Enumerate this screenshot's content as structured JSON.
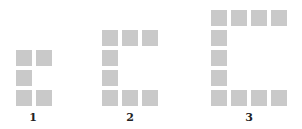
{
  "diagram": {
    "type": "pattern-sequence",
    "square_color": "#c9c9c9",
    "figures": [
      {
        "label": "1",
        "cells": [
          [
            0,
            0
          ],
          [
            1,
            0
          ],
          [
            0,
            1
          ],
          [
            0,
            2
          ],
          [
            1,
            2
          ]
        ],
        "origin": [
          16,
          50
        ]
      },
      {
        "label": "2",
        "cells": [
          [
            0,
            0
          ],
          [
            1,
            0
          ],
          [
            2,
            0
          ],
          [
            0,
            1
          ],
          [
            0,
            2
          ],
          [
            0,
            3
          ],
          [
            1,
            3
          ],
          [
            2,
            3
          ]
        ],
        "origin": [
          102,
          30
        ]
      },
      {
        "label": "3",
        "cells": [
          [
            0,
            0
          ],
          [
            1,
            0
          ],
          [
            2,
            0
          ],
          [
            3,
            0
          ],
          [
            0,
            1
          ],
          [
            0,
            2
          ],
          [
            0,
            3
          ],
          [
            0,
            4
          ],
          [
            1,
            4
          ],
          [
            2,
            4
          ],
          [
            3,
            4
          ]
        ],
        "origin": [
          211,
          10
        ]
      }
    ]
  }
}
